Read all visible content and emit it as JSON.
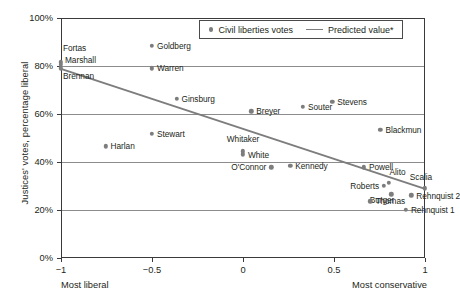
{
  "chart_data": {
    "type": "scatter",
    "title": "",
    "xlabel": "",
    "ylabel": "Justices' votes, percentage liberal",
    "xlim": [
      -1,
      1
    ],
    "ylim": [
      0,
      1
    ],
    "grid": true,
    "legend_position": "top-right",
    "x_axis": {
      "ticks": [
        -1,
        -0.5,
        0,
        0.5,
        1
      ],
      "tick_labels": [
        "−1",
        "−0.5",
        "0",
        "0.5",
        "1"
      ],
      "left_end_label": "Most liberal",
      "right_end_label": "Most conservative"
    },
    "y_axis": {
      "ticks": [
        0,
        0.2,
        0.4,
        0.6,
        0.8,
        1.0
      ],
      "tick_labels": [
        "0%",
        "20%",
        "40%",
        "60%",
        "80%",
        "100%"
      ]
    },
    "legend": [
      {
        "label": "Civil liberties votes",
        "marker": "dot",
        "color": "#7d7d7d"
      },
      {
        "label": "Predicted value*",
        "marker": "line",
        "color": "#7d7d7d"
      }
    ],
    "series": [
      {
        "name": "Civil liberties votes",
        "type": "scatter",
        "color": "#7d7d7d",
        "points": [
          {
            "label": "Fortas",
            "x": -1.0,
            "y": 0.815,
            "label_pos": "above-right",
            "dx": 2,
            "dy": -14
          },
          {
            "label": "Marshall",
            "x": -1.0,
            "y": 0.805,
            "label_pos": "right",
            "dx": 4,
            "dy": -5
          },
          {
            "label": "Brennan",
            "x": -1.0,
            "y": 0.79,
            "label_pos": "below-right",
            "dx": 2,
            "dy": 8
          },
          {
            "label": "Goldberg",
            "x": -0.5,
            "y": 0.885,
            "label_pos": "right",
            "dx": 5,
            "dy": 0
          },
          {
            "label": "Warren",
            "x": -0.5,
            "y": 0.79,
            "label_pos": "right",
            "dx": 5,
            "dy": 0
          },
          {
            "label": "Ginsburg",
            "x": -0.365,
            "y": 0.663,
            "label_pos": "right",
            "dx": 5,
            "dy": 0
          },
          {
            "label": "Breyer",
            "x": 0.045,
            "y": 0.612,
            "label_pos": "right",
            "dx": 5,
            "dy": 0
          },
          {
            "label": "Souter",
            "x": 0.33,
            "y": 0.63,
            "label_pos": "right",
            "dx": 5,
            "dy": 0
          },
          {
            "label": "Stevens",
            "x": 0.49,
            "y": 0.652,
            "label_pos": "right",
            "dx": 5,
            "dy": 0
          },
          {
            "label": "Blackmun",
            "x": 0.755,
            "y": 0.535,
            "label_pos": "right",
            "dx": 5,
            "dy": 0
          },
          {
            "label": "Stewart",
            "x": -0.5,
            "y": 0.518,
            "label_pos": "right",
            "dx": 5,
            "dy": 0
          },
          {
            "label": "Harlan",
            "x": -0.755,
            "y": 0.465,
            "label_pos": "right",
            "dx": 5,
            "dy": 0
          },
          {
            "label": "Whitaker",
            "x": 0.0,
            "y": 0.445,
            "label_pos": "above",
            "dx": 0,
            "dy": -12
          },
          {
            "label": "White",
            "x": 0.0,
            "y": 0.432,
            "label_pos": "right",
            "dx": 5,
            "dy": 1
          },
          {
            "label": "O'Connor",
            "x": 0.155,
            "y": 0.378,
            "label_pos": "left",
            "dx": -5,
            "dy": 0
          },
          {
            "label": "Kennedy",
            "x": 0.26,
            "y": 0.385,
            "label_pos": "right",
            "dx": 5,
            "dy": 0
          },
          {
            "label": "Powell",
            "x": 0.665,
            "y": 0.378,
            "label_pos": "right",
            "dx": 5,
            "dy": 0
          },
          {
            "label": "Alito",
            "x": 0.8,
            "y": 0.313,
            "label_pos": "above-right",
            "dx": 1,
            "dy": -11
          },
          {
            "label": "Scalia",
            "x": 1.0,
            "y": 0.29,
            "label_pos": "above",
            "dx": -4,
            "dy": -11
          },
          {
            "label": "Roberts",
            "x": 0.775,
            "y": 0.3,
            "label_pos": "left",
            "dx": -5,
            "dy": 0
          },
          {
            "label": "Burger",
            "x": 0.815,
            "y": 0.265,
            "label_pos": "left-below",
            "dx": 3,
            "dy": 6
          },
          {
            "label": "Rehnquist 2",
            "x": 0.925,
            "y": 0.262,
            "label_pos": "right",
            "dx": 5,
            "dy": 1
          },
          {
            "label": "Thomas",
            "x": 0.7,
            "y": 0.236,
            "label_pos": "right",
            "dx": 5,
            "dy": 0
          },
          {
            "label": "Rehnquist 1",
            "x": 0.895,
            "y": 0.2,
            "label_pos": "right",
            "dx": 5,
            "dy": 0
          }
        ]
      },
      {
        "name": "Predicted value*",
        "type": "line",
        "color": "#7d7d7d",
        "x": [
          -1.0,
          1.0
        ],
        "values": [
          0.788,
          0.288
        ]
      }
    ]
  }
}
